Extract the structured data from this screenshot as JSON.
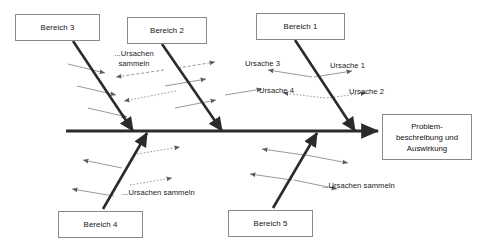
{
  "diagram": {
    "type": "ishikawa-fishbone",
    "spine": {
      "label": "spine-arrow",
      "x1": 66,
      "y1": 131,
      "x2": 378,
      "y2": 131
    },
    "effect": {
      "name": "problem-statement-box",
      "lines": [
        "Problem-",
        "beschreibung und",
        "Auswirkung"
      ],
      "x": 382,
      "y": 114,
      "w": 90,
      "h": 46
    },
    "categories": [
      {
        "id": "bereich-3",
        "label": "Bereich 3",
        "box": {
          "x": 15,
          "y": 14,
          "w": 85,
          "h": 27
        },
        "bone": {
          "x1": 73,
          "y1": 41,
          "x2": 133,
          "y2": 131
        },
        "side": "top"
      },
      {
        "id": "bereich-2",
        "label": "Bereich 2",
        "box": {
          "x": 127,
          "y": 17,
          "w": 80,
          "h": 27
        },
        "bone": {
          "x1": 162,
          "y1": 44,
          "x2": 222,
          "y2": 131
        },
        "side": "top"
      },
      {
        "id": "bereich-1",
        "label": "Bereich 1",
        "box": {
          "x": 256,
          "y": 13,
          "w": 89,
          "h": 27
        },
        "bone": {
          "x1": 295,
          "y1": 40,
          "x2": 355,
          "y2": 131
        },
        "side": "top"
      },
      {
        "id": "bereich-4",
        "label": "Bereich 4",
        "box": {
          "x": 58,
          "y": 211,
          "w": 85,
          "h": 27
        },
        "bone": {
          "x1": 103,
          "y1": 209,
          "x2": 147,
          "y2": 133
        },
        "side": "bottom"
      },
      {
        "id": "bereich-5",
        "label": "Bereich 5",
        "box": {
          "x": 228,
          "y": 210,
          "w": 85,
          "h": 27
        },
        "bone": {
          "x1": 273,
          "y1": 208,
          "x2": 317,
          "y2": 133
        },
        "side": "bottom"
      }
    ],
    "cause_labels": [
      {
        "id": "ursache-3",
        "text": "Ursache 3",
        "x": 245,
        "y": 59
      },
      {
        "id": "ursache-1",
        "text": "Ursache 1",
        "x": 330,
        "y": 61
      },
      {
        "id": "ursache-4",
        "text": "Ursache 4",
        "x": 259,
        "y": 86
      },
      {
        "id": "ursache-2",
        "text": "Ursache 2",
        "x": 349,
        "y": 87
      }
    ],
    "hint_labels": [
      {
        "id": "hint-bereich-2",
        "lines": [
          "...Ursachen",
          "sammeln"
        ],
        "x": 103,
        "y": 49,
        "w": 62,
        "multiline": true
      },
      {
        "id": "hint-bereich-4",
        "lines": [
          "...Ursachen sammeln"
        ],
        "x": 122,
        "y": 188,
        "w": 90,
        "multiline": false
      },
      {
        "id": "hint-bereich-5",
        "lines": [
          "...Ursachen sammeln"
        ],
        "x": 322,
        "y": 181,
        "w": 90,
        "multiline": false
      }
    ],
    "cause_bones": [
      {
        "id": "cause-line-b3-1",
        "x1": 68,
        "y1": 64,
        "x2": 105,
        "y2": 73,
        "style": "solid"
      },
      {
        "id": "cause-line-b3-2",
        "x1": 77,
        "y1": 86,
        "x2": 116,
        "y2": 95,
        "style": "solid"
      },
      {
        "id": "cause-line-b3-3",
        "x1": 88,
        "y1": 108,
        "x2": 127,
        "y2": 117,
        "style": "solid"
      },
      {
        "id": "cause-line-b3-hint",
        "x1": 164,
        "y1": 70,
        "x2": 116,
        "y2": 77,
        "style": "dashed"
      },
      {
        "id": "cause-line-b3-4",
        "x1": 176,
        "y1": 91,
        "x2": 124,
        "y2": 101,
        "style": "dotted"
      },
      {
        "id": "cause-line-b2-1",
        "x1": 178,
        "y1": 68,
        "x2": 215,
        "y2": 62,
        "style": "dashed"
      },
      {
        "id": "cause-line-b2-2",
        "x1": 165,
        "y1": 86,
        "x2": 206,
        "y2": 79,
        "style": "solid"
      },
      {
        "id": "cause-line-b2-3",
        "x1": 175,
        "y1": 108,
        "x2": 216,
        "y2": 100,
        "style": "solid"
      },
      {
        "id": "cause-line-b2-4",
        "x1": 225,
        "y1": 95,
        "x2": 262,
        "y2": 89,
        "style": "solid"
      },
      {
        "id": "cause-line-b1-1",
        "x1": 312,
        "y1": 77,
        "x2": 268,
        "y2": 70,
        "style": "solid"
      },
      {
        "id": "cause-line-b1-2",
        "x1": 314,
        "y1": 77,
        "x2": 352,
        "y2": 71,
        "style": "solid"
      },
      {
        "id": "cause-line-b1-3",
        "x1": 325,
        "y1": 98,
        "x2": 283,
        "y2": 93,
        "style": "dotted"
      },
      {
        "id": "cause-line-b1-4",
        "x1": 327,
        "y1": 98,
        "x2": 366,
        "y2": 93,
        "style": "dotted"
      },
      {
        "id": "cause-line-b4-1",
        "x1": 137,
        "y1": 154,
        "x2": 180,
        "y2": 147,
        "style": "dotted"
      },
      {
        "id": "cause-line-b4-2",
        "x1": 122,
        "y1": 168,
        "x2": 83,
        "y2": 160,
        "style": "solid"
      },
      {
        "id": "cause-line-b4-3",
        "x1": 130,
        "y1": 185,
        "x2": 172,
        "y2": 178,
        "style": "dotted"
      },
      {
        "id": "cause-line-b4-4",
        "x1": 114,
        "y1": 196,
        "x2": 72,
        "y2": 189,
        "style": "solid"
      },
      {
        "id": "cause-line-b5-1",
        "x1": 306,
        "y1": 155,
        "x2": 348,
        "y2": 163,
        "style": "solid"
      },
      {
        "id": "cause-line-b5-2",
        "x1": 304,
        "y1": 155,
        "x2": 262,
        "y2": 149,
        "style": "solid"
      },
      {
        "id": "cause-line-b5-3",
        "x1": 294,
        "y1": 180,
        "x2": 337,
        "y2": 189,
        "style": "solid"
      },
      {
        "id": "cause-line-b5-4",
        "x1": 292,
        "y1": 180,
        "x2": 250,
        "y2": 174,
        "style": "solid"
      }
    ],
    "colors": {
      "bone": "#2b2b2b",
      "cause_line": "#8d8d8d",
      "box_border": "#8a8a8a",
      "text": "#111111",
      "background": "#ffffff"
    }
  }
}
